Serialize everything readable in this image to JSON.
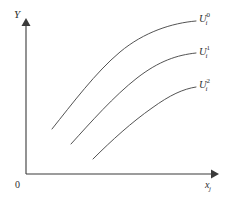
{
  "figure": {
    "background_color": "#ffffff",
    "ink_color": "#3a3a3a",
    "curve_color": "#4a4a4a"
  },
  "axes": {
    "y_label": "Y",
    "x_label_base": "x",
    "x_label_sub": "j",
    "origin_label": "0",
    "x_axis": {
      "x1": 26,
      "y1": 174,
      "x2": 213,
      "y2": 174
    },
    "y_axis": {
      "x1": 26,
      "y1": 174,
      "x2": 26,
      "y2": 24
    }
  },
  "curves": [
    {
      "id": "curve-0",
      "label_base": "U",
      "label_sub": "i",
      "label_sup": "0",
      "path": "M 52 129 C 72 104, 96 72, 120 52 C 144 32, 172 23, 196 21"
    },
    {
      "id": "curve-1",
      "label_base": "U",
      "label_sub": "i",
      "label_sup": "1",
      "path": "M 71 144 C 91 122, 114 96, 137 78 C 159 61, 177 55, 196 53"
    },
    {
      "id": "curve-2",
      "label_base": "U",
      "label_sub": "i",
      "label_sup": "2",
      "path": "M 93 159 C 112 140, 132 122, 152 108 C 170 95, 183 89, 196 87"
    }
  ],
  "chart_data": {
    "type": "line",
    "title": "",
    "xlabel": "x_j",
    "ylabel": "Y",
    "grid": false,
    "legend_position": "right-inline",
    "annotations": [
      "0"
    ],
    "series": [
      {
        "name": "U_i^0",
        "x": [
          52,
          72,
          96,
          120,
          144,
          172,
          196
        ],
        "y": [
          129,
          107,
          78,
          55,
          36,
          25,
          21
        ]
      },
      {
        "name": "U_i^1",
        "x": [
          71,
          91,
          114,
          137,
          159,
          177,
          196
        ],
        "y": [
          144,
          124,
          100,
          80,
          63,
          56,
          53
        ]
      },
      {
        "name": "U_i^2",
        "x": [
          93,
          112,
          132,
          152,
          170,
          183,
          196
        ],
        "y": [
          159,
          142,
          124,
          109,
          96,
          90,
          87
        ]
      }
    ]
  }
}
